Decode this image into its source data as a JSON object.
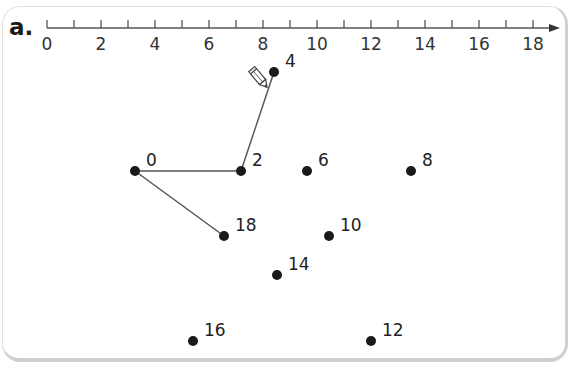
{
  "exercise": {
    "part_label": "a.",
    "number_line": {
      "min": 0,
      "max": 18,
      "step_minor": 1,
      "labels": [
        "0",
        "2",
        "4",
        "6",
        "8",
        "10",
        "12",
        "14",
        "16",
        "18"
      ]
    },
    "dots": [
      {
        "label": "0",
        "x": 135,
        "y": 171
      },
      {
        "label": "2",
        "x": 241,
        "y": 171
      },
      {
        "label": "4",
        "x": 274,
        "y": 72
      },
      {
        "label": "6",
        "x": 307,
        "y": 171
      },
      {
        "label": "8",
        "x": 411,
        "y": 171
      },
      {
        "label": "10",
        "x": 329,
        "y": 236
      },
      {
        "label": "12",
        "x": 371,
        "y": 341
      },
      {
        "label": "14",
        "x": 277,
        "y": 275
      },
      {
        "label": "16",
        "x": 193,
        "y": 341
      },
      {
        "label": "18",
        "x": 224,
        "y": 236
      }
    ],
    "connections": [
      [
        "0",
        "2"
      ],
      [
        "2",
        "4"
      ],
      [
        "0",
        "18"
      ]
    ],
    "icons": {
      "pencil": "pencil-icon"
    },
    "colors": {
      "ink": "#1a1a1a",
      "line": "#555555",
      "card_border": "#d0d0d0"
    }
  }
}
